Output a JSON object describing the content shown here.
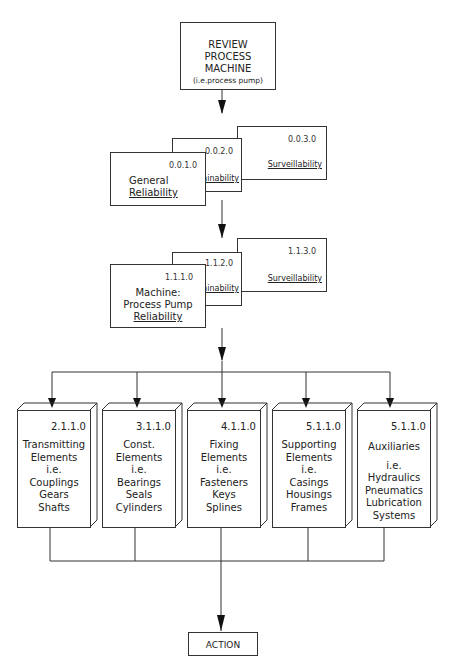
{
  "top": {
    "lines": [
      "REVIEW",
      "PROCESS",
      "MACHINE"
    ],
    "sub": "(i.e.process pump)"
  },
  "level0": {
    "general": {
      "code": "0.0.1.0",
      "line1": "General",
      "line2": "Reliability"
    },
    "maintain": {
      "code": "0.0.2.0",
      "label": "Maintainability"
    },
    "surveil": {
      "code": "0.0.3.0",
      "label": "Surveillability"
    }
  },
  "level1": {
    "machine": {
      "code": "1.1.1.0",
      "line1": "Machine:",
      "line2": "Process Pump",
      "line3": "Reliability"
    },
    "maintain": {
      "code": "1.1.2.0",
      "label": "Maintainability"
    },
    "surveil": {
      "code": "1.1.3.0",
      "label": "Surveillability"
    }
  },
  "elements": [
    {
      "code": "2.1.1.0",
      "lines": [
        "Transmitting",
        "Elements",
        "i.e.",
        "Couplings",
        "Gears",
        "Shafts"
      ]
    },
    {
      "code": "3.1.1.0",
      "lines": [
        "Const.",
        "Elements",
        "i.e.",
        "Bearings",
        "Seals",
        "Cylinders"
      ]
    },
    {
      "code": "4.1.1.0",
      "lines": [
        "Fixing",
        "Elements",
        "i.e.",
        "Fasteners",
        "Keys",
        "Splines"
      ]
    },
    {
      "code": "5.1.1.0",
      "lines": [
        "Supporting",
        "Elements",
        "i.e.",
        "Casings",
        "Housings",
        "Frames"
      ]
    },
    {
      "code": "5.1.1.0",
      "lines": [
        "",
        "Auxiliaries",
        "i.e.",
        "Hydraulics",
        "Pneumatics",
        "Lubrication",
        "Systems"
      ]
    }
  ],
  "action": {
    "label": "ACTION"
  }
}
